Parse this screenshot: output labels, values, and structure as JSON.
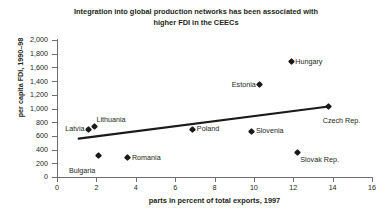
{
  "chart_data": {
    "type": "scatter",
    "title": "Integration into global production networks has been associated with higher FDI in the CEECs",
    "title_line1": "Integration into global production networks has been associated with",
    "title_line2": "higher FDI in the CEECs",
    "xlabel": "parts in percent of total exports, 1997",
    "ylabel": "per capita FDI, 1990–98",
    "xlim": [
      0,
      16
    ],
    "ylim": [
      0,
      2000
    ],
    "xticks": [
      0,
      2,
      4,
      6,
      8,
      10,
      12,
      14,
      16
    ],
    "xtick_labels": [
      "0",
      "2",
      "4",
      "6",
      "8",
      "10",
      "12",
      "14",
      "16"
    ],
    "yticks": [
      0,
      200,
      400,
      600,
      800,
      1000,
      1200,
      1400,
      1600,
      1800,
      2000
    ],
    "ytick_labels": [
      "0",
      "200",
      "400",
      "600",
      "800",
      "1,000",
      "1,200",
      "1,400",
      "1,600",
      "1,800",
      "2,000"
    ],
    "grid": false,
    "legend": "none",
    "marker_color": "#1a1a1a",
    "axis_color": "#6d6e71",
    "trendline_color": "#1a1a1a",
    "points": [
      {
        "label": "Latvia",
        "x": 1.6,
        "y": 700,
        "label_side": "left"
      },
      {
        "label": "Lithuania",
        "x": 1.9,
        "y": 740,
        "label_side": "right"
      },
      {
        "label": "Bulgaria",
        "x": 2.1,
        "y": 310,
        "label_side": "left"
      },
      {
        "label": "Romania",
        "x": 3.6,
        "y": 280,
        "label_side": "right"
      },
      {
        "label": "Poland",
        "x": 6.9,
        "y": 700,
        "label_side": "right"
      },
      {
        "label": "Estonia",
        "x": 10.3,
        "y": 1350,
        "label_side": "left"
      },
      {
        "label": "Slovenia",
        "x": 9.9,
        "y": 670,
        "label_side": "right"
      },
      {
        "label": "Hungary",
        "x": 11.9,
        "y": 1680,
        "label_side": "right"
      },
      {
        "label": "Slovak Rep.",
        "x": 12.2,
        "y": 360,
        "label_side": "right"
      },
      {
        "label": "Czech Rep.",
        "x": 13.8,
        "y": 1030,
        "label_side": "right"
      }
    ],
    "trendline": {
      "x1": 1.1,
      "y1": 560,
      "x2": 13.8,
      "y2": 1030
    }
  }
}
